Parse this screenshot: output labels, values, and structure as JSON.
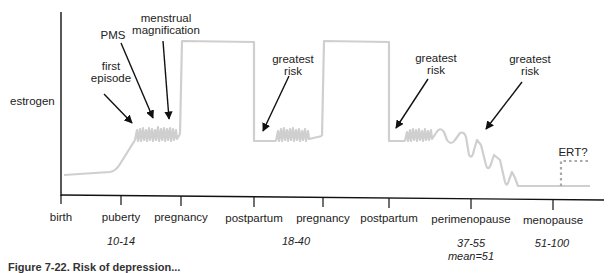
{
  "diagram": {
    "type": "timeline-curve",
    "y_axis_label": "estrogen",
    "x_axis_labels": [
      {
        "label": "birth",
        "x": 61
      },
      {
        "label": "puberty",
        "x": 121
      },
      {
        "label": "pregnancy",
        "x": 181
      },
      {
        "label": "postpartum",
        "x": 254
      },
      {
        "label": "pregnancy",
        "x": 323
      },
      {
        "label": "postpartum",
        "x": 389
      },
      {
        "label": "perimenopause",
        "x": 471
      },
      {
        "label": "menopause",
        "x": 553
      }
    ],
    "age_ranges": [
      {
        "text": "10-14",
        "under": "puberty"
      },
      {
        "text": "18-40",
        "under": "postpartum / pregnancy"
      },
      {
        "text": "37-55",
        "under": "perimenopause"
      },
      {
        "text": "mean=51",
        "under": "perimenopause"
      },
      {
        "text": "51-100",
        "under": "menopause"
      }
    ],
    "annotations": [
      {
        "text_lines": [
          "first",
          "episode"
        ]
      },
      {
        "text_lines": [
          "PMS"
        ]
      },
      {
        "text_lines": [
          "menstrual",
          "magnification"
        ]
      },
      {
        "text_lines": [
          "greatest",
          "risk"
        ]
      },
      {
        "text_lines": [
          "greatest",
          "risk"
        ]
      },
      {
        "text_lines": [
          "greatest",
          "risk"
        ]
      },
      {
        "text_lines": [
          "ERT?"
        ]
      }
    ],
    "caption": "Figure 7-22. Risk of depression...",
    "colors": {
      "curve": "#cfcfcf",
      "axis": "#111111",
      "arrow": "#111111",
      "ert_dotted": "#a8a8a8"
    }
  }
}
